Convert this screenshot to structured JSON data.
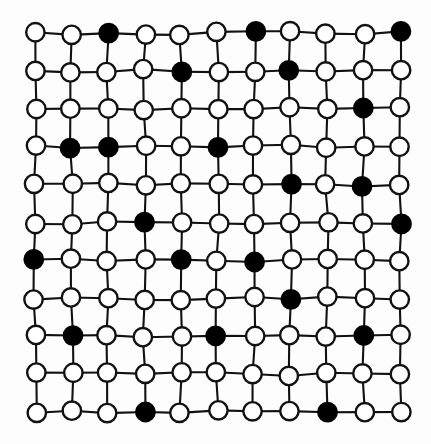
{
  "figure": {
    "caption": "",
    "type": "lattice-diagram",
    "width": 431,
    "height": 444
  },
  "colors": {
    "background": "#fdfdfd",
    "page_background": "#ffffff",
    "edge_stroke": "#111111",
    "node_stroke": "#111111",
    "node_empty_fill": "#ffffff",
    "node_filled_fill": "#000000"
  },
  "geometry": {
    "rows": 11,
    "cols": 11,
    "origin_x": 35,
    "origin_y": 33,
    "spacing_x": 36.5,
    "spacing_y": 37.9,
    "node_radius": 9.2,
    "edge_stroke_width": 2.1,
    "node_stroke_width": 2.4,
    "jitter_seed": 7,
    "jitter_amplitude": 1.9
  },
  "chart_data": {
    "type": "heatmap",
    "xlabel": "",
    "ylabel": "",
    "grid": true,
    "legend": [
      {
        "key": "empty",
        "label": "empty site (open circle)",
        "color": "#ffffff"
      },
      {
        "key": "filled",
        "label": "occupied site (filled circle)",
        "color": "#000000"
      }
    ],
    "rows": 11,
    "cols": 11,
    "row_labels": [
      "1",
      "2",
      "3",
      "4",
      "5",
      "6",
      "7",
      "8",
      "9",
      "10",
      "11"
    ],
    "col_labels": [
      "1",
      "2",
      "3",
      "4",
      "5",
      "6",
      "7",
      "8",
      "9",
      "10",
      "11"
    ],
    "filled_count": 22,
    "total_sites": 121,
    "filled_fraction": 0.182,
    "filled_sites_by_row": [
      [
        3,
        7,
        11
      ],
      [
        5,
        8
      ],
      [
        10
      ],
      [
        2,
        3,
        6
      ],
      [
        8,
        10
      ],
      [
        4,
        11
      ],
      [
        1,
        5,
        7
      ],
      [
        8
      ],
      [
        2,
        6,
        10
      ],
      [],
      [
        4,
        9
      ]
    ],
    "matrix": [
      [
        0,
        0,
        1,
        0,
        0,
        0,
        1,
        0,
        0,
        0,
        1
      ],
      [
        0,
        0,
        0,
        0,
        1,
        0,
        0,
        1,
        0,
        0,
        0
      ],
      [
        0,
        0,
        0,
        0,
        0,
        0,
        0,
        0,
        0,
        1,
        0
      ],
      [
        0,
        1,
        1,
        0,
        0,
        1,
        0,
        0,
        0,
        0,
        0
      ],
      [
        0,
        0,
        0,
        0,
        0,
        0,
        0,
        1,
        0,
        1,
        0
      ],
      [
        0,
        0,
        0,
        1,
        0,
        0,
        0,
        0,
        0,
        0,
        1
      ],
      [
        1,
        0,
        0,
        0,
        1,
        0,
        1,
        0,
        0,
        0,
        0
      ],
      [
        0,
        0,
        0,
        0,
        0,
        0,
        0,
        1,
        0,
        0,
        0
      ],
      [
        0,
        1,
        0,
        0,
        0,
        1,
        0,
        0,
        0,
        1,
        0
      ],
      [
        0,
        0,
        0,
        0,
        0,
        0,
        0,
        0,
        0,
        0,
        0
      ],
      [
        0,
        0,
        0,
        1,
        0,
        0,
        0,
        0,
        1,
        0,
        0
      ]
    ]
  }
}
